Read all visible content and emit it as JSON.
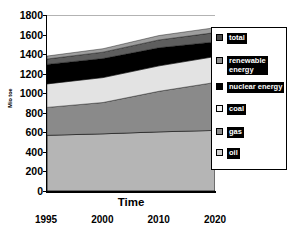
{
  "chart_data": {
    "type": "area",
    "title": "",
    "xlabel": "Time",
    "ylabel": "Mio toe",
    "categories": [
      "1995",
      "2000",
      "2010",
      "2020"
    ],
    "x": [
      1995,
      2000,
      2010,
      2020
    ],
    "ylim": [
      0,
      1800
    ],
    "ytick_step": 200,
    "yticks": [
      "1800",
      "1600",
      "1400",
      "1200",
      "1000",
      "800",
      "600",
      "400",
      "200",
      "0"
    ],
    "grid": true,
    "stacked": true,
    "legend_position": "right",
    "series": [
      {
        "name": "oil",
        "values": [
          570,
          585,
          605,
          620
        ],
        "color": "#b5b5b5"
      },
      {
        "name": "gas",
        "values": [
          285,
          320,
          415,
          490
        ],
        "color": "#8a8a8a"
      },
      {
        "name": "coal",
        "values": [
          240,
          255,
          260,
          265
        ],
        "color": "#e3e3e3"
      },
      {
        "name": "nuclear energy",
        "values": [
          200,
          195,
          185,
          150
        ],
        "color": "#000000"
      },
      {
        "name": "renewable energy",
        "values": [
          55,
          65,
          80,
          95
        ],
        "color": "#5e5e5e"
      },
      {
        "name": "total",
        "values": [
          30,
          35,
          45,
          50
        ],
        "color": "#9e9e9e"
      }
    ],
    "totals": [
      1380,
      1455,
      1590,
      1670
    ]
  },
  "axes": {
    "y_title": "Mio toe",
    "x_title": "Time"
  },
  "legend": {
    "items": [
      {
        "label": "total",
        "swatch": "#4a4a4a"
      },
      {
        "label": "renewable\nenergy",
        "swatch": "#8f8f8f"
      },
      {
        "label": "nuclear energy",
        "swatch": "#000000"
      },
      {
        "label": "coal",
        "swatch": "#f2f2f2"
      },
      {
        "label": "gas",
        "swatch": "#8a8a8a"
      },
      {
        "label": "oil",
        "swatch": "#d0d0d0"
      }
    ]
  }
}
